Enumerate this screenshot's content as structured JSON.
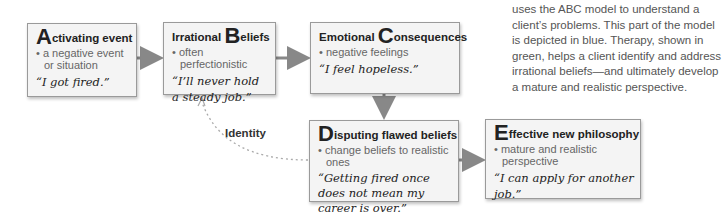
{
  "diagram": {
    "boxes": {
      "a": {
        "initial": "A",
        "title_rest": "ctivating event",
        "bullet": "• a negative event or situation",
        "quote": "“I got fired.”"
      },
      "b": {
        "prefix": "Irrational ",
        "initial": "B",
        "title_rest": "eliefs",
        "bullet": "• often perfectionistic",
        "quote": "“I’ll never hold a steady job.”"
      },
      "c": {
        "prefix": "Emotional ",
        "initial": "C",
        "title_rest": "onsequences",
        "bullet": "• negative feelings",
        "quote": "“I feel hopeless.”"
      },
      "d": {
        "initial": "D",
        "title_rest": "isputing flawed beliefs",
        "bullet": "• change beliefs to realistic ones",
        "quote": "“Getting fired once does not mean my career is over.”"
      },
      "e": {
        "initial": "E",
        "title_rest": "ffective new philosophy",
        "bullet": "• mature and realistic perspective",
        "quote": "“I can apply for another job.”"
      }
    },
    "identity_label": "Identity",
    "colors": {
      "box_fill": "#f4f4f4",
      "box_border": "#9a9a9a",
      "arrow": "#888888",
      "dotted": "#aaaaaa"
    }
  },
  "sidebar": {
    "text": "uses the ABC model to understand a client’s problems. This part of the model is depicted in blue. Therapy, shown in green, helps a client identify and address irrational beliefs—and ultimately develop a mature and realistic perspective."
  }
}
